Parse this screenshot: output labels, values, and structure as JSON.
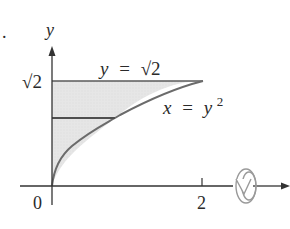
{
  "figure": {
    "bullet": ".",
    "axes": {
      "y_label": "y",
      "origin_label": "0",
      "x_tick_label": "2",
      "y_tick_label": "√2"
    },
    "curves": {
      "top_line_label": {
        "lhs": "y",
        "eq": "=",
        "rhs": "√2"
      },
      "parabola_label": {
        "lhs": "x",
        "eq": "=",
        "base": "y",
        "exp": "2"
      }
    },
    "icons": {
      "rotation": "rotate-about-x-axis-icon"
    },
    "colors": {
      "region_fill": "#e4e4e4",
      "curve": "#6b6b6b",
      "axis": "#333333",
      "strip": "#555555",
      "icon": "#9a9a9a"
    }
  }
}
